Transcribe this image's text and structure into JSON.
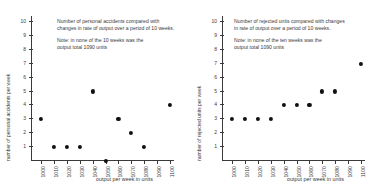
{
  "figure": {
    "background": "#ffffff",
    "point_color": "#111111",
    "axis_color": "#3a3a3a"
  },
  "panels": [
    {
      "id": "personal-accidents",
      "note": {
        "line1": "Number of personal accidents compared with",
        "line2": "changes in rate of output over a period of 10 weeks.",
        "line3": "Note: in none of the 10 weeks was the",
        "line4": "output total 1090 units"
      },
      "chart_data": {
        "type": "scatter",
        "title": "Number of personal accidents compared with changes in rate of output over a period of 10 weeks.",
        "xlabel": "output per week in units",
        "ylabel": "number of personal accidents per week",
        "xlim": [
          1000,
          1100
        ],
        "ylim": [
          0,
          10
        ],
        "grid": false,
        "legend": false,
        "xticks": [
          "1000",
          "1010",
          "1020",
          "1030",
          "1040",
          "1050",
          "1060",
          "1070",
          "1080",
          "1090",
          "1100"
        ],
        "yticks": [
          "1",
          "2",
          "3",
          "4",
          "5",
          "6",
          "7",
          "8",
          "9",
          "10"
        ],
        "x": [
          1000,
          1010,
          1020,
          1030,
          1040,
          1050,
          1060,
          1070,
          1080,
          1100
        ],
        "y": [
          3,
          1,
          1,
          1,
          5,
          0,
          3,
          2,
          1,
          4
        ],
        "missing_x": [
          1090
        ]
      }
    },
    {
      "id": "rejected-units",
      "note": {
        "line1": "Number of rejected units compared with changes",
        "line2": "in rate of output over a period of 10 weeks.",
        "line3": "Note: in none of the ten weeks was the",
        "line4": "output total 1090 units"
      },
      "chart_data": {
        "type": "scatter",
        "title": "Number of rejected units compared with changes in rate of output over a period of 10 weeks.",
        "xlabel": "output per week in units",
        "ylabel": "number of rejected units per week",
        "xlim": [
          1000,
          1100
        ],
        "ylim": [
          0,
          10
        ],
        "grid": false,
        "legend": false,
        "xticks": [
          "1000",
          "1010",
          "1020",
          "1030",
          "1040",
          "1050",
          "1060",
          "1070",
          "1080",
          "1090",
          "1100"
        ],
        "yticks": [
          "1",
          "2",
          "3",
          "4",
          "5",
          "6",
          "7",
          "8",
          "9",
          "10"
        ],
        "x": [
          1000,
          1010,
          1020,
          1030,
          1040,
          1050,
          1060,
          1070,
          1080,
          1100
        ],
        "y": [
          3,
          3,
          3,
          3,
          4,
          4,
          4,
          5,
          5,
          7
        ],
        "missing_x": [
          1090
        ]
      }
    }
  ]
}
